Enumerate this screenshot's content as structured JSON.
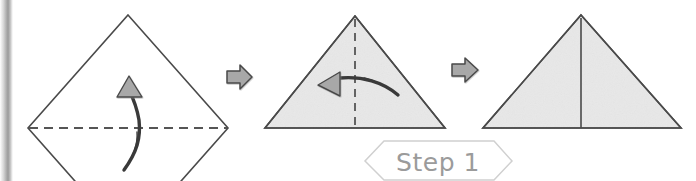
{
  "page": {
    "background_color": "#ffffff",
    "width": 696,
    "height": 181,
    "type": "origami-instruction-diagram"
  },
  "spine": {
    "name": "page-binding-shadow",
    "shadow_color": "#9a9a9a"
  },
  "colors": {
    "paper_fill_unfolded": "#ffffff",
    "paper_fill_folded": "#e8e8e8",
    "paper_outline": "#4a4a4a",
    "fold_line_dashed": "#555555",
    "transition_arrow_fill": "#a8a8a8",
    "transition_arrow_stroke": "#4a4a4a",
    "motion_arrow_stroke": "#3a3a3a",
    "motion_arrow_head_fill": "#a8a8a8",
    "step_banner_stroke": "#d0d0d0",
    "step_label_text": "#9b9b9b"
  },
  "figures": [
    {
      "id": "figure-1",
      "name": "unfolded-square-diamond",
      "shape": "diamond",
      "fill": "#ffffff",
      "fold_line": {
        "orientation": "horizontal",
        "style": "dashed",
        "label": "valley-fold"
      },
      "motion_arrow": {
        "direction": "up",
        "label": "fold-bottom-up"
      }
    },
    {
      "id": "figure-2",
      "name": "folded-triangle-with-center-crease",
      "shape": "triangle",
      "fill": "#e8e8e8",
      "fold_line": {
        "orientation": "vertical",
        "style": "dashed",
        "label": "valley-fold"
      },
      "motion_arrow": {
        "direction": "left",
        "label": "fold-right-to-left"
      }
    },
    {
      "id": "figure-3",
      "name": "result-triangle-with-center-line",
      "shape": "triangle",
      "fill": "#e8e8e8",
      "fold_line": {
        "orientation": "vertical",
        "style": "solid",
        "label": "finished-crease"
      },
      "motion_arrow": null
    }
  ],
  "transitions": [
    {
      "id": "transition-1",
      "name": "arrow-figure1-to-figure2",
      "direction": "right"
    },
    {
      "id": "transition-2",
      "name": "arrow-figure2-to-figure3",
      "direction": "right"
    }
  ],
  "step_banner": {
    "label": "Step 1",
    "shape": "hexagon"
  }
}
